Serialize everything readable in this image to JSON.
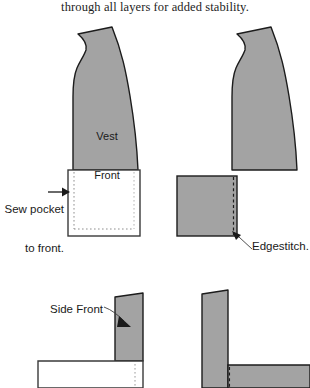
{
  "caption": {
    "text": "through all layers for added stability."
  },
  "colors": {
    "fabric_gray": "#a3a3a3",
    "outline_dark": "#1c1c1c",
    "pocket_white": "#ffffff",
    "stitch_gray": "#9a9a9a",
    "page_background": "#ffffff",
    "text": "#1a1a1a"
  },
  "figures": {
    "top_left": {
      "name": "vest front with pocket attached",
      "piece_label": "Vest\nFront",
      "annotation": "Sew pocket\nto front."
    },
    "top_right": {
      "name": "vest front with pocket edgestitched",
      "annotation": "Edgestitch."
    },
    "bottom_left": {
      "name": "side front panel",
      "piece_label": "Side Front"
    },
    "bottom_right": {
      "name": "side front joined to pocket"
    }
  },
  "labels": {
    "vest_front": "Vest\nFront",
    "vest_front_line1": "Vest",
    "vest_front_line2": "Front",
    "sew_pocket_line1": "Sew pocket",
    "sew_pocket_line2": "to front.",
    "edgestitch": "Edgestitch.",
    "side_front": "Side Front"
  }
}
